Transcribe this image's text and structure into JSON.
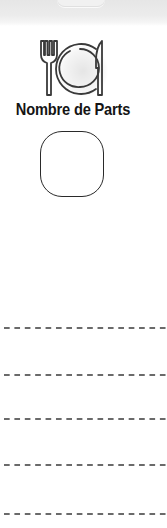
{
  "header": {
    "tab_visible": true
  },
  "section": {
    "icon": "plate-fork-knife-icon",
    "title": "Nombre de Parts"
  },
  "parts_input": {
    "value": "",
    "placeholder": ""
  },
  "writing_lines": {
    "count": 5,
    "y_positions": [
      328,
      375,
      419,
      465,
      514
    ],
    "style": "dashed",
    "color": "#6a6a6a"
  },
  "colors": {
    "background": "#ffffff",
    "top_band": "#ececec",
    "text": "#141414",
    "icon_stroke": "#3a3a3a",
    "input_border": "#2a2a2a"
  }
}
